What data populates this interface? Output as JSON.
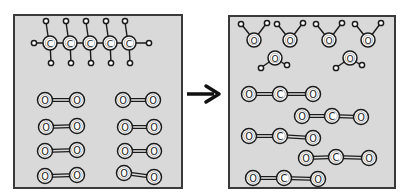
{
  "diagram": {
    "colors": {
      "panel_bg": "#d9d9d9",
      "panel_border": "#3a3a3a",
      "atom_fill": "#ffffff",
      "atom_stroke": "#1a1a1a",
      "arrow": "#111111"
    },
    "reactants_panel": {
      "label": "Reactants",
      "pentane": {
        "formula": "C5H12",
        "carbon_label": "C",
        "carbons": [
          50,
          70,
          90,
          110,
          129
        ],
        "carbon_y": 43
      },
      "oxygen_molecules": {
        "formula": "O2",
        "atom_label": "O",
        "count": 8
      }
    },
    "arrow": {
      "label": "reaction-arrow",
      "direction": "right"
    },
    "products_panel": {
      "label": "Products",
      "water": {
        "formula": "H2O",
        "atom_label": "O",
        "count": 6
      },
      "carbon_dioxide": {
        "formula": "CO2",
        "carbon_label": "C",
        "oxygen_label": "O",
        "count": 5
      }
    }
  }
}
